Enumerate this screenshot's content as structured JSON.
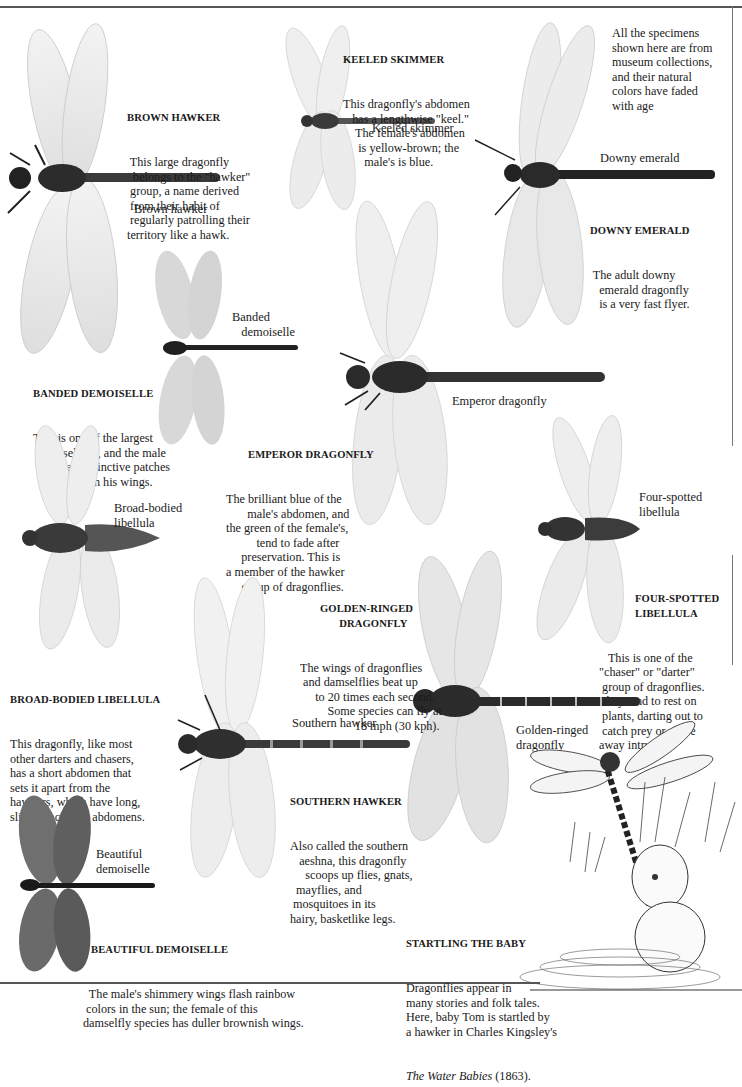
{
  "page": {
    "note": "All the specimens\nshown here are from\nmuseum collections,\nand their natural\ncolors have faded\nwith age"
  },
  "specimens": [
    {
      "id": "brown-hawker",
      "label": "Brown hawker",
      "heading": "BROWN HAWKER",
      "text": " This large dragonfly\n  belongs to the \"hawker\"\n group, a name derived\n from their habit of\n regularly patrolling their\nterritory like a hawk."
    },
    {
      "id": "keeled-skimmer",
      "label": "Keeled skimmer",
      "heading": "KEELED SKIMMER",
      "text": "This dragonfly's abdomen\n   has a lengthwise \"keel.\"\n    The female's abdomen\n     is yellow-brown; the\n       male's is blue."
    },
    {
      "id": "downy-emerald",
      "label": "Downy emerald",
      "heading": "DOWNY EMERALD",
      "text": " The adult downy\n   emerald dragonfly\n   is a very fast flyer."
    },
    {
      "id": "banded-demoiselle",
      "label": "Banded\n   demoiselle",
      "heading": "BANDED DEMOISELLE",
      "text": "This is one of the largest\n   damselflies, and the male\n         has distinctive patches\n                  on his wings."
    },
    {
      "id": "emperor-dragonfly",
      "label": "Emperor dragonfly",
      "heading": "EMPEROR DRAGONFLY",
      "text": "The brilliant blue of the\n       male's abdomen, and\nthe green of the female's,\n          tend to fade after\n     preservation. This is\na member of the hawker\n     group of dragonflies."
    },
    {
      "id": "broad-bodied-libellula",
      "label": "Broad-bodied\nlibellula",
      "heading": "BROAD-BODIED LIBELLULA",
      "text": "This dragonfly, like most\nother darters and chasers,\nhas a short abdomen that\nsets it apart from the\nhawkers, which have long,\nslim, pencil-like abdomens."
    },
    {
      "id": "four-spotted-libellula",
      "label": "Four-spotted\nlibellula",
      "heading": "FOUR-SPOTTED\nLIBELLULA",
      "text": "   This is one of the\n\"chaser\" or \"darter\"\n group of dragonflies.\nThey tend to rest on\n plants, darting out to\n catch prey or chase\naway intruders."
    },
    {
      "id": "golden-ringed-dragonfly",
      "label": "Golden-ringed\ndragonfly",
      "heading": "GOLDEN-RINGED\n       DRAGONFLY",
      "text": "The wings of dragonflies\n and damselflies beat up\n     to 20 times each second.\n         Some species can fly at\n                  18 mph (30 kph)."
    },
    {
      "id": "southern-hawker",
      "label": "Southern hawker",
      "heading": "SOUTHERN HAWKER",
      "text": "Also called the southern\n   aeshna, this dragonfly\n     scoops up flies, gnats,\n  mayflies, and\n mosquitoes in its\nhairy, basketlike legs."
    },
    {
      "id": "beautiful-demoiselle",
      "label": "Beautiful\ndemoiselle",
      "heading": "BEAUTIFUL DEMOISELLE",
      "text": "  The male's shimmery wings flash rainbow\n colors in the sun; the female of this\ndamselfly species has duller brownish wings."
    }
  ],
  "illustration": {
    "heading": "STARTLING THE BABY",
    "text": "Dragonflies appear in\nmany stories and folk tales.\nHere, baby Tom is startled by\na hawker in Charles Kingsley's",
    "book_title": "The Water Babies",
    "year": " (1863)."
  },
  "colors": {
    "ink": "#1a1a1a",
    "rule": "#555555",
    "wing": "#e9e9e9",
    "body_dark": "#2e2e2e"
  }
}
